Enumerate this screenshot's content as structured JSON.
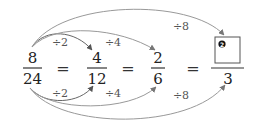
{
  "diagram": {
    "fractions": [
      {
        "numerator": "8",
        "denominator": "24"
      },
      {
        "numerator": "4",
        "denominator": "12"
      },
      {
        "numerator": "2",
        "denominator": "6"
      },
      {
        "numerator": "",
        "denominator": "3",
        "blank_badge": "❷"
      }
    ],
    "equals": [
      "=",
      "=",
      "="
    ],
    "top_operations": [
      "÷2",
      "÷4",
      "÷8"
    ],
    "bottom_operations": [
      "÷2",
      "÷4",
      "÷8"
    ],
    "colors": {
      "arc": "#999999",
      "text": "#222222"
    }
  }
}
